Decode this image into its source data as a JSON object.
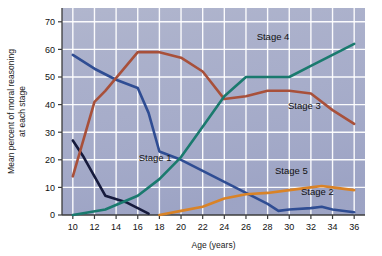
{
  "chart_data": {
    "type": "line",
    "title": "",
    "xlabel": "Age (years)",
    "ylabel": "Mean percent of moral reasoning at each stage",
    "ylabel_line1": "Mean percent of moral reasoning",
    "ylabel_line2": "at each stage",
    "xlim": [
      9,
      37
    ],
    "ylim": [
      0,
      75
    ],
    "x_ticks": [
      10,
      12,
      14,
      16,
      18,
      20,
      22,
      24,
      26,
      28,
      30,
      32,
      34,
      36
    ],
    "y_ticks": [
      0,
      10,
      20,
      30,
      40,
      50,
      60,
      70
    ],
    "grid": true,
    "legend": "inline-labels",
    "plot_bg": "#a8aec8",
    "grid_color": "#ffffff",
    "series": [
      {
        "name": "Stage 1",
        "color": "#161a3c",
        "label_x": 17.6,
        "label_y": 19.5,
        "x": [
          10,
          11,
          13,
          15,
          17
        ],
        "values": [
          27,
          21,
          7,
          4.5,
          0.5
        ]
      },
      {
        "name": "Stage 2",
        "color": "#2f4d93",
        "label_x": 32.6,
        "label_y": 7.2,
        "x": [
          10,
          12,
          14,
          16,
          17,
          18,
          20,
          22,
          24,
          26,
          28,
          29,
          30,
          32,
          33,
          34,
          36
        ],
        "values": [
          58,
          53,
          49,
          46,
          37,
          23,
          20,
          16,
          12,
          8,
          4,
          1.5,
          2,
          2.5,
          3,
          2,
          1
        ]
      },
      {
        "name": "Stage 3",
        "color": "#a8503a",
        "label_x": 31.4,
        "label_y": 38.5,
        "x": [
          10,
          12,
          13,
          16,
          18,
          20,
          22,
          24,
          26,
          28,
          30,
          32,
          34,
          36
        ],
        "values": [
          14,
          41,
          45,
          59,
          59,
          57,
          52,
          42,
          43,
          45,
          45,
          44,
          38,
          33
        ]
      },
      {
        "name": "Stage 4",
        "color": "#1a7a6e",
        "label_x": 28.5,
        "label_y": 63.5,
        "x": [
          10,
          13,
          16,
          18,
          20,
          22,
          24,
          26,
          28,
          30,
          32,
          34,
          36
        ],
        "values": [
          0,
          2,
          7,
          13,
          21,
          32,
          43,
          50,
          50,
          50,
          54,
          58,
          62
        ]
      },
      {
        "name": "Stage 5",
        "color": "#d98327",
        "label_x": 30.2,
        "label_y": 15.0,
        "x": [
          18,
          20,
          22,
          24,
          26,
          28,
          30,
          32,
          33,
          34,
          36
        ],
        "values": [
          0,
          1.5,
          3,
          6,
          7.5,
          8,
          9,
          10,
          10.5,
          10,
          9
        ]
      }
    ]
  }
}
